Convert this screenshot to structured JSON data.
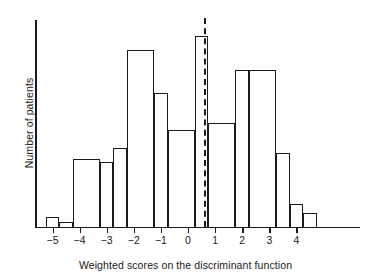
{
  "chart_data": {
    "type": "bar",
    "title": "",
    "subtitle": "",
    "xlabel": "Weighted scores on the discriminant function",
    "ylabel": "Number of patients",
    "grid": false,
    "legend": null,
    "xlim": [
      -5.5,
      5.0
    ],
    "ylim": [
      0,
      20
    ],
    "xticks": [
      "−5",
      "−4",
      "−3",
      "−2",
      "−1",
      "0",
      "1",
      "2",
      "3",
      "4"
    ],
    "xtick_values": [
      -5,
      -4,
      -3,
      -2,
      -1,
      0,
      1,
      2,
      3,
      4
    ],
    "yticks": [],
    "bin_edges": [
      -5.25,
      -4.75,
      -4.25,
      -3.25,
      -2.75,
      -2.25,
      -1.25,
      -0.75,
      0.25,
      0.75,
      1.75,
      2.25,
      3.25,
      3.75,
      4.25,
      4.75
    ],
    "categories": [
      "−5.25 to −4.75",
      "−4.75 to −4.25",
      "−4.25 to −3.25",
      "−3.25 to −2.75",
      "−2.75 to −2.25",
      "−2.25 to −1.25",
      "−1.25 to −0.75",
      "−0.75 to 0.25",
      "0.25 to 0.75",
      "0.75 to 1.75",
      "1.75 to 2.25",
      "2.25 to 3.25",
      "3.25 to 3.75",
      "3.75 to 4.25",
      "4.25 to 4.75"
    ],
    "values": [
      1.1,
      0.5,
      7.0,
      6.7,
      8.1,
      18.1,
      13.7,
      9.9,
      19.5,
      10.6,
      16.0,
      16.0,
      7.6,
      2.4,
      1.5
    ],
    "bars": [
      {
        "x0": -5.25,
        "x1": -4.75,
        "value": 1.1
      },
      {
        "x0": -4.75,
        "x1": -4.25,
        "value": 0.5
      },
      {
        "x0": -4.25,
        "x1": -3.25,
        "value": 7.0
      },
      {
        "x0": -3.25,
        "x1": -2.75,
        "value": 6.7
      },
      {
        "x0": -2.75,
        "x1": -2.25,
        "value": 8.1
      },
      {
        "x0": -2.25,
        "x1": -1.25,
        "value": 18.1
      },
      {
        "x0": -1.25,
        "x1": -0.75,
        "value": 13.7
      },
      {
        "x0": -0.75,
        "x1": 0.25,
        "value": 9.9
      },
      {
        "x0": 0.25,
        "x1": 0.75,
        "value": 19.5
      },
      {
        "x0": 0.75,
        "x1": 1.75,
        "value": 10.6
      },
      {
        "x0": 1.75,
        "x1": 2.25,
        "value": 16.0
      },
      {
        "x0": 2.25,
        "x1": 3.25,
        "value": 16.0
      },
      {
        "x0": 3.25,
        "x1": 3.75,
        "value": 7.6
      },
      {
        "x0": 3.75,
        "x1": 4.25,
        "value": 2.4
      },
      {
        "x0": 4.25,
        "x1": 4.75,
        "value": 1.5
      }
    ],
    "annotations": [
      {
        "name": "cutoff-line",
        "type": "vertical-dashed-line",
        "x": 0.6,
        "label": "",
        "color": "#1a1a1a"
      }
    ],
    "colors": {
      "bar_edge": "#1a1a1a",
      "bar_fill": "transparent",
      "axis": "#1a1a1a",
      "cutoff": "#1a1a1a",
      "background": "#ffffff"
    }
  }
}
